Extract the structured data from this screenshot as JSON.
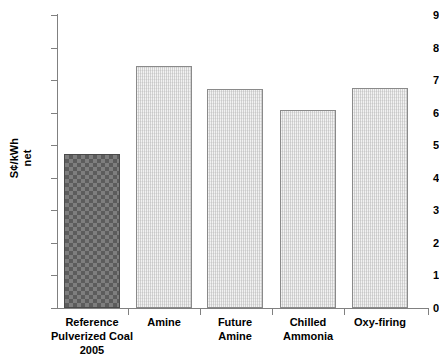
{
  "chart_data": {
    "type": "bar",
    "title": "",
    "subtitle": "",
    "xlabel": "",
    "ylabel": "S¢/kWh net",
    "ylabel_lines": [
      "S¢/kWh",
      "net"
    ],
    "categories": [
      "Reference\nPulverized Coal\n2005",
      "Amine",
      "Future\nAmine",
      "Chilled\nAmmonia",
      "Oxy-firing"
    ],
    "values": [
      4.72,
      7.42,
      6.72,
      6.08,
      6.75
    ],
    "ylim": [
      0,
      9
    ],
    "yticks": [
      0,
      1,
      2,
      3,
      4,
      5,
      6,
      7,
      8,
      9
    ],
    "ytick_labels": [
      "0",
      "1",
      "2",
      "3",
      "4",
      "5",
      "6",
      "7",
      "8",
      "9"
    ],
    "grid": false,
    "legend": null,
    "legend_position": "none",
    "bar_styles": [
      "checker",
      "plain",
      "plain",
      "plain",
      "plain"
    ],
    "colors": {
      "reference_bar_fill": "#6d6d6d",
      "reference_bar_edge": "#4a4a4a",
      "other_bar_fill": "#f2f2f2",
      "other_bar_edge": "#8a8a8a",
      "axis": "#808080",
      "text": "#000000",
      "background": "#ffffff"
    }
  }
}
